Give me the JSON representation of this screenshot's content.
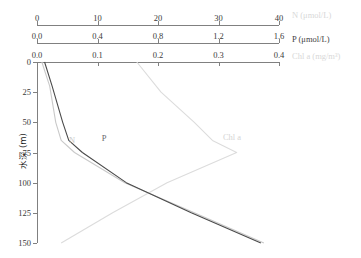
{
  "figure": {
    "caption": "",
    "y_axis_title": "水深 (m)"
  },
  "axes": {
    "n": {
      "name": "N (μmol/L)",
      "ticks": [
        "0",
        "10",
        "20",
        "30",
        "40"
      ],
      "min": 0,
      "max": 40
    },
    "p": {
      "name": "P (μmol/L)",
      "ticks": [
        "0.0",
        "0.4",
        "0.8",
        "1.2",
        "1.6"
      ],
      "min": 0,
      "max": 1.6
    },
    "chl": {
      "name": "Chl a (mg/m³)",
      "ticks": [
        "0.0",
        "0.1",
        "0.2",
        "0.3",
        "0.4"
      ],
      "min": 0,
      "max": 0.4
    },
    "depth": {
      "ticks": [
        "0",
        "25",
        "50",
        "75",
        "100",
        "125",
        "150"
      ],
      "min": 0,
      "max": 150
    }
  },
  "curve_labels": {
    "n": "N",
    "p": "P",
    "chl": "Chl a"
  },
  "colors": {
    "n": "#c9c9c9",
    "p": "#4a4a4a",
    "chl": "#dcdcdc",
    "axis": "#808080",
    "text": "#3a3a3a"
  },
  "chart_data": {
    "type": "line",
    "title": "",
    "xlabel": "N (μmol/L) / P (μmol/L) / Chl a (mg/m³)",
    "ylabel": "水深 (m)",
    "ylim": [
      0,
      150
    ],
    "y_inverted": true,
    "grid": false,
    "legend": "in-plot curve labels",
    "series": [
      {
        "name": "N",
        "label": "N (μmol/L)",
        "unit": "μmol/L",
        "axis": "n",
        "xlim": [
          0,
          40
        ],
        "color": "#c9c9c9",
        "points": [
          {
            "depth": 0,
            "value": 0.8
          },
          {
            "depth": 20,
            "value": 2.1
          },
          {
            "depth": 50,
            "value": 3.1
          },
          {
            "depth": 65,
            "value": 4.0
          },
          {
            "depth": 75,
            "value": 6.2
          },
          {
            "depth": 100,
            "value": 14.5
          },
          {
            "depth": 125,
            "value": 26.0
          },
          {
            "depth": 150,
            "value": 37.5
          }
        ]
      },
      {
        "name": "P",
        "label": "P (μmol/L)",
        "unit": "μmol/L",
        "axis": "p",
        "xlim": [
          0,
          1.6
        ],
        "color": "#4a4a4a",
        "points": [
          {
            "depth": 0,
            "value": 0.05
          },
          {
            "depth": 20,
            "value": 0.1
          },
          {
            "depth": 50,
            "value": 0.17
          },
          {
            "depth": 65,
            "value": 0.21
          },
          {
            "depth": 75,
            "value": 0.3
          },
          {
            "depth": 100,
            "value": 0.59
          },
          {
            "depth": 125,
            "value": 1.02
          },
          {
            "depth": 150,
            "value": 1.48
          }
        ]
      },
      {
        "name": "Chl a",
        "label": "Chl a (mg/m³)",
        "unit": "mg/m³",
        "axis": "chl",
        "xlim": [
          0,
          0.4
        ],
        "color": "#dcdcdc",
        "points": [
          {
            "depth": 0,
            "value": 0.165
          },
          {
            "depth": 25,
            "value": 0.205
          },
          {
            "depth": 50,
            "value": 0.26
          },
          {
            "depth": 65,
            "value": 0.29
          },
          {
            "depth": 75,
            "value": 0.33
          },
          {
            "depth": 100,
            "value": 0.215
          },
          {
            "depth": 125,
            "value": 0.125
          },
          {
            "depth": 150,
            "value": 0.04
          }
        ]
      }
    ]
  }
}
